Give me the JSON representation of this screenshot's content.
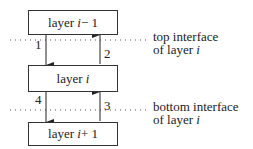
{
  "layers": {
    "top": {
      "prefix": "layer ",
      "var": "i",
      "suffix": " − 1"
    },
    "middle": {
      "prefix": "layer ",
      "var": "i",
      "suffix": ""
    },
    "bottom": {
      "prefix": "layer ",
      "var": "i",
      "suffix": " + 1"
    }
  },
  "arrows": [
    {
      "label": "1",
      "direction": "down",
      "from": "layer i − 1",
      "to": "layer i"
    },
    {
      "label": "2",
      "direction": "up",
      "from": "layer i",
      "to": "layer i − 1"
    },
    {
      "label": "3",
      "direction": "up",
      "from": "layer i + 1",
      "to": "layer i"
    },
    {
      "label": "4",
      "direction": "down",
      "from": "layer i",
      "to": "layer i + 1"
    }
  ],
  "interfaces": {
    "top": {
      "line1": "top interface",
      "line2_prefix": "of layer ",
      "line2_var": "i"
    },
    "bottom": {
      "line1": "bottom interface",
      "line2_prefix": "of layer ",
      "line2_var": "i"
    }
  }
}
